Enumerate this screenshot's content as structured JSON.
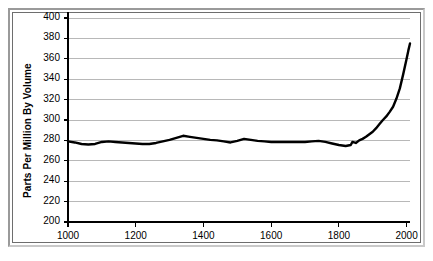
{
  "chart_data": {
    "type": "line",
    "title": "",
    "subtitle": "",
    "xlabel": "",
    "ylabel": "Parts Per Million By Volume",
    "xlim": [
      1000,
      2010
    ],
    "ylim": [
      200,
      400
    ],
    "grid": true,
    "legend": null,
    "legend_position": "none",
    "y_ticks": [
      200,
      220,
      240,
      260,
      280,
      300,
      320,
      340,
      360,
      380,
      400
    ],
    "x_ticks": [
      1000,
      1200,
      1400,
      1600,
      1800,
      2000
    ],
    "y_tick_labels": [
      "200",
      "220",
      "240",
      "260",
      "280",
      "300",
      "320",
      "340",
      "360",
      "380",
      "400"
    ],
    "x_tick_labels": [
      "1000",
      "1200",
      "1400",
      "1600",
      "1800",
      "2000"
    ],
    "series": [
      {
        "name": "Atmospheric concentration",
        "color": "#000000",
        "x": [
          1000,
          1020,
          1040,
          1060,
          1080,
          1100,
          1120,
          1140,
          1160,
          1180,
          1200,
          1220,
          1240,
          1260,
          1280,
          1300,
          1320,
          1340,
          1360,
          1380,
          1400,
          1420,
          1440,
          1460,
          1480,
          1500,
          1520,
          1540,
          1560,
          1580,
          1600,
          1620,
          1640,
          1660,
          1680,
          1700,
          1720,
          1740,
          1760,
          1780,
          1800,
          1820,
          1835,
          1840,
          1850,
          1860,
          1870,
          1880,
          1890,
          1900,
          1910,
          1920,
          1930,
          1940,
          1950,
          1960,
          1970,
          1980,
          1990,
          2000,
          2005,
          2010
        ],
        "y": [
          279,
          278,
          276.5,
          276,
          276.5,
          278.5,
          279,
          278.5,
          278,
          277.5,
          277,
          276.5,
          276.5,
          277.5,
          279,
          280.5,
          282.5,
          284.5,
          283.5,
          282.5,
          281.5,
          280.5,
          280,
          279,
          278,
          279.5,
          281.5,
          280.5,
          279.5,
          279,
          278.5,
          278.5,
          278.5,
          278.5,
          278.5,
          278.5,
          279,
          279.5,
          278.5,
          277,
          275.5,
          274.5,
          275.5,
          278.5,
          277.5,
          280,
          281.5,
          283.5,
          286,
          288.5,
          292,
          296,
          300,
          303.5,
          308,
          313,
          321,
          331,
          345,
          360,
          368,
          375
        ]
      }
    ],
    "annotations": []
  },
  "colors": {
    "line": "#000000",
    "gridline": "#b8b8b8",
    "axis": "#000000",
    "plot_background": "#ffffff",
    "frame_highlight": "#c9c9c9",
    "frame_shadow": "#9a9a9a"
  }
}
